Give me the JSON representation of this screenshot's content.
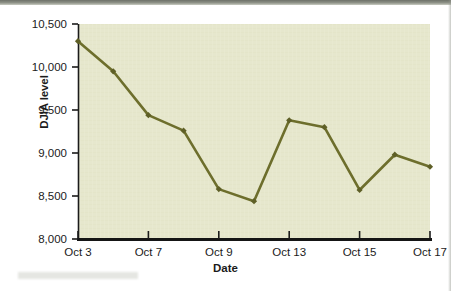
{
  "chart_data": {
    "type": "line",
    "title": "",
    "xlabel": "Date",
    "ylabel": "DJIA level",
    "x_tick_labels": [
      "Oct 3",
      "Oct 7",
      "Oct 9",
      "Oct 13",
      "Oct 15",
      "Oct 17"
    ],
    "y_tick_labels": [
      "8,000",
      "8,500",
      "9,000",
      "9,500",
      "10,000",
      "10,500"
    ],
    "ylim": [
      8000,
      10500
    ],
    "y_ticks": [
      8000,
      8500,
      9000,
      9500,
      10000,
      10500
    ],
    "grid": false,
    "legend": false,
    "legend_position": "none",
    "marker": "diamond",
    "line_color": "#6d6e2c",
    "marker_color": "#5e5f26",
    "plot_background": "#e6e7cd",
    "axis_color": "#1b1b1b",
    "categories": [
      "Oct 3",
      "Oct 6",
      "Oct 7",
      "Oct 8",
      "Oct 9",
      "Oct 10",
      "Oct 13",
      "Oct 14",
      "Oct 15",
      "Oct 16",
      "Oct 17"
    ],
    "values": [
      10300,
      9950,
      9440,
      9260,
      8580,
      8440,
      9380,
      9300,
      8570,
      8980,
      8840
    ],
    "series": [
      {
        "name": "DJIA level",
        "values": [
          10300,
          9950,
          9440,
          9260,
          8580,
          8440,
          9380,
          9300,
          8570,
          8980,
          8840
        ]
      }
    ],
    "points": [
      {
        "label": "Oct 3",
        "x": 0,
        "y": 10300
      },
      {
        "label": "Oct 6",
        "x": 1,
        "y": 9950
      },
      {
        "label": "Oct 7",
        "x": 2,
        "y": 9440
      },
      {
        "label": "Oct 8",
        "x": 3,
        "y": 9260
      },
      {
        "label": "Oct 9",
        "x": 4,
        "y": 8580
      },
      {
        "label": "Oct 10",
        "x": 5,
        "y": 8440
      },
      {
        "label": "Oct 13",
        "x": 6,
        "y": 9380
      },
      {
        "label": "Oct 14",
        "x": 7,
        "y": 9300
      },
      {
        "label": "Oct 15",
        "x": 8,
        "y": 8570
      },
      {
        "label": "Oct 16",
        "x": 9,
        "y": 8980
      },
      {
        "label": "Oct 17",
        "x": 10,
        "y": 8840
      }
    ],
    "labeled_tick_indices": [
      0,
      2,
      4,
      6,
      8,
      10
    ]
  }
}
